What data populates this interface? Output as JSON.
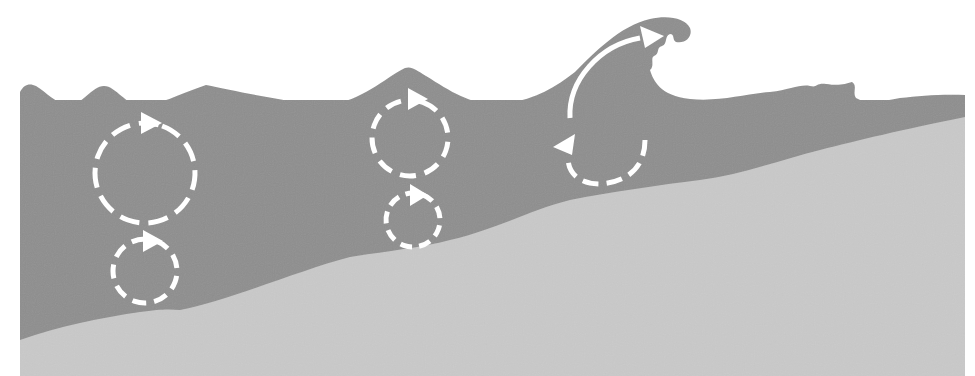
{
  "figure": {
    "type": "diagram",
    "colors": {
      "background": "#ffffff",
      "water": "#8e8e8e",
      "seabed": "#c9c9c9",
      "orbit_stroke": "#ffffff"
    },
    "panels": [
      {
        "id": "deep-water",
        "orbits": [
          {
            "label": "surface-orbit",
            "cx": 145,
            "cy": 173,
            "r": 50,
            "shape": "circle"
          },
          {
            "label": "subsurface-orbit",
            "cx": 145,
            "cy": 271,
            "r": 32,
            "shape": "circle"
          }
        ]
      },
      {
        "id": "shoaling-water",
        "orbits": [
          {
            "label": "surface-orbit",
            "cx": 410,
            "cy": 138,
            "r": 38,
            "shape": "circle"
          },
          {
            "label": "subsurface-orbit",
            "cx": 413,
            "cy": 220,
            "r": 27,
            "shape": "circle"
          }
        ]
      },
      {
        "id": "breaking-wave",
        "orbits": [
          {
            "label": "elongated-orbit",
            "shape": "open-ellipse-breaking"
          }
        ]
      }
    ]
  }
}
